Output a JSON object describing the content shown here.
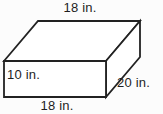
{
  "figure": {
    "type": "rectangular-prism-diagram",
    "labels": {
      "top_width": "18 in.",
      "height": "10 in.",
      "depth": "20 in.",
      "bottom_width": "18 in."
    },
    "colors": {
      "line": "#222222",
      "face": "#ffffff",
      "background": "#fcfcfc",
      "text": "#1e1e1e"
    }
  }
}
